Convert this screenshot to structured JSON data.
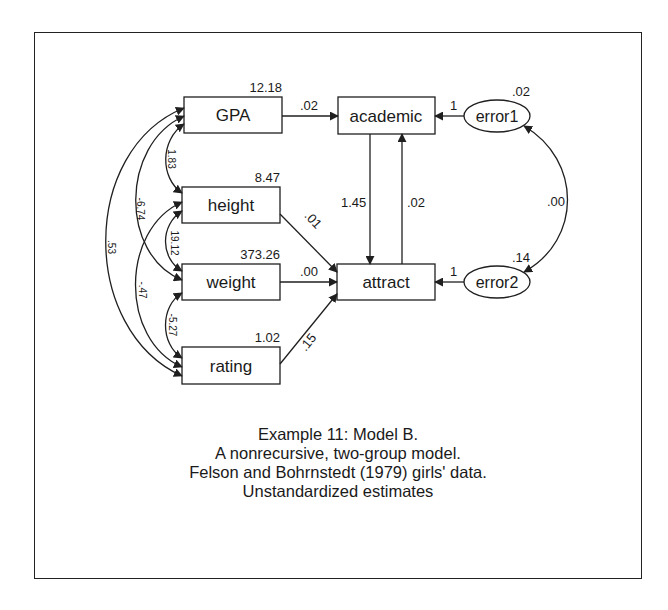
{
  "diagram": {
    "observed": [
      {
        "id": "gpa",
        "label": "GPA",
        "variance": "12.18"
      },
      {
        "id": "height",
        "label": "height",
        "variance": "8.47"
      },
      {
        "id": "weight",
        "label": "weight",
        "variance": "373.26"
      },
      {
        "id": "rating",
        "label": "rating",
        "variance": "1.02"
      },
      {
        "id": "academic",
        "label": "academic"
      },
      {
        "id": "attract",
        "label": "attract"
      }
    ],
    "errors": [
      {
        "id": "error1",
        "label": "error1",
        "variance": ".02"
      },
      {
        "id": "error2",
        "label": "error2",
        "variance": ".14"
      }
    ],
    "paths": [
      {
        "from": "GPA",
        "to": "academic",
        "estimate": ".02"
      },
      {
        "from": "height",
        "to": "attract",
        "estimate": ".01"
      },
      {
        "from": "weight",
        "to": "attract",
        "estimate": ".00"
      },
      {
        "from": "rating",
        "to": "attract",
        "estimate": ".15"
      },
      {
        "from": "academic",
        "to": "attract",
        "estimate": "1.45"
      },
      {
        "from": "attract",
        "to": "academic",
        "estimate": ".02"
      },
      {
        "from": "error1",
        "to": "academic",
        "estimate": "1"
      },
      {
        "from": "error2",
        "to": "attract",
        "estimate": "1"
      }
    ],
    "covariances": [
      {
        "a": "GPA",
        "b": "height",
        "estimate": "1.83"
      },
      {
        "a": "GPA",
        "b": "weight",
        "estimate": "-6.74"
      },
      {
        "a": "GPA",
        "b": "rating",
        "estimate": ".53"
      },
      {
        "a": "height",
        "b": "weight",
        "estimate": "19.12"
      },
      {
        "a": "height",
        "b": "rating",
        "estimate": "-.47"
      },
      {
        "a": "weight",
        "b": "rating",
        "estimate": "-5.27"
      },
      {
        "a": "error1",
        "b": "error2",
        "estimate": ".00"
      }
    ]
  },
  "caption": {
    "line1": "Example 11: Model B.",
    "line2": "A nonrecursive, two-group model.",
    "line3": "Felson and Bohrnstedt (1979) girls' data.",
    "line4": "Unstandardized estimates"
  },
  "colors": {
    "line": "#1f1f1f",
    "background": "#ffffff"
  }
}
